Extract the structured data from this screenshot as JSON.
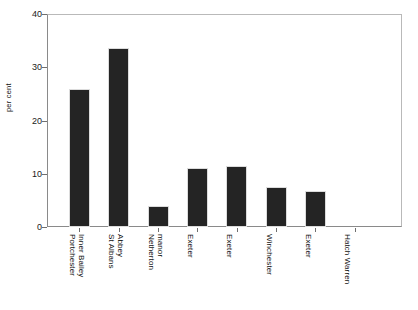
{
  "chart_data": {
    "type": "bar",
    "title": "",
    "xlabel": "",
    "ylabel": "per cent",
    "ylim": [
      0,
      40
    ],
    "yticks": [
      0,
      10,
      20,
      30,
      40
    ],
    "grid": false,
    "legend": "none",
    "orientation": "vertical",
    "bar_color": "#242424",
    "categories": [
      "Portchester Inner Bailey",
      "St Albans Abbey",
      "Netherton manor",
      "Exeter",
      "Exeter",
      "Winchester",
      "Exeter",
      "Hatch Warren"
    ],
    "category_label_lines": [
      [
        "Portchester",
        "Inner Bailey"
      ],
      [
        "St Albans",
        "Abbey"
      ],
      [
        "Netherton",
        "manor"
      ],
      [
        "Exeter",
        ""
      ],
      [
        "Exeter",
        ""
      ],
      [
        "Winchester",
        ""
      ],
      [
        "Exeter",
        ""
      ],
      [
        "Hatch Warren",
        ""
      ]
    ],
    "values": [
      26.0,
      33.6,
      4.0,
      11.0,
      11.5,
      7.5,
      6.8,
      0.0
    ]
  },
  "axis": {
    "y_title": "per cent",
    "y_tick_labels": [
      "0",
      "10",
      "20",
      "30",
      "40"
    ]
  }
}
